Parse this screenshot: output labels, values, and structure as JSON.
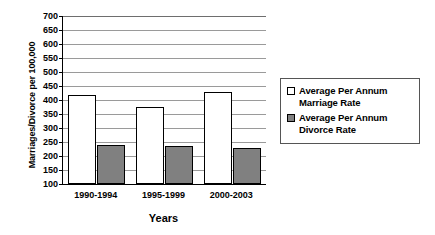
{
  "chart_data": {
    "type": "bar",
    "title": "",
    "xlabel": "Years",
    "ylabel": "Marriages/Divorce per 100,000",
    "categories": [
      "1990-1994",
      "1995-1999",
      "2000-2003"
    ],
    "series": [
      {
        "name": "Average Per Annum Marriage Rate",
        "color": "#ffffff",
        "values": [
          418,
          375,
          428
        ]
      },
      {
        "name": "Average Per Annum Divorce Rate",
        "color": "#808080",
        "values": [
          238,
          236,
          229
        ]
      }
    ],
    "ylim": [
      100,
      700
    ],
    "ytick_step": 50,
    "yticks": [
      700,
      650,
      600,
      550,
      500,
      450,
      400,
      350,
      300,
      250,
      200,
      150,
      100
    ],
    "grid": true,
    "legend_position": "right"
  },
  "legend": {
    "entries": [
      {
        "line1": "Average Per Annum",
        "line2": "Marriage Rate"
      },
      {
        "line1": "Average Per Annum",
        "line2": "Divorce Rate"
      }
    ]
  },
  "colors": {
    "marriage_bar": "#ffffff",
    "divorce_bar": "#808080",
    "axis": "#000000",
    "gridline": "#9a9a9a",
    "background": "#ffffff"
  }
}
